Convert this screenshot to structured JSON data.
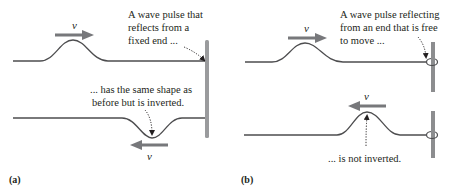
{
  "figure": {
    "panels": [
      {
        "label": "(a)",
        "end_type": "fixed",
        "top": {
          "velocity_label": "v",
          "velocity_direction": "right",
          "caption_lines": [
            "A wave pulse that",
            "reflects from a",
            "fixed end ..."
          ]
        },
        "bottom": {
          "velocity_label": "v",
          "velocity_direction": "left",
          "caption_lines": [
            "... has the same shape as",
            "before but is inverted."
          ]
        }
      },
      {
        "label": "(b)",
        "end_type": "free",
        "top": {
          "velocity_label": "v",
          "velocity_direction": "right",
          "caption_lines": [
            "A wave pulse reflecting",
            "from an end that is free",
            "to move ..."
          ]
        },
        "bottom": {
          "velocity_label": "v",
          "velocity_direction": "left",
          "caption_lines": [
            "... is not inverted."
          ]
        }
      }
    ],
    "colors": {
      "string": "#4d4d4f",
      "arrow": "#77787b",
      "wall": "#9a9b9d",
      "post": "#8c8d8f",
      "text": "#231f20",
      "background": "#ffffff"
    }
  }
}
